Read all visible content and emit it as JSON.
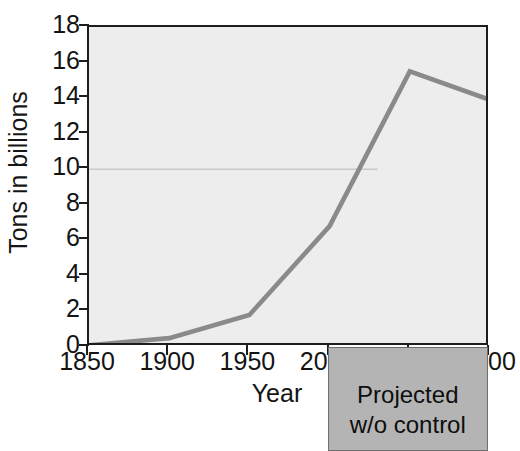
{
  "chart_data": {
    "type": "line",
    "title": "",
    "subtitle": "",
    "xlabel": "Year",
    "ylabel": "Tons in billions",
    "xlim": [
      1850,
      2100
    ],
    "ylim": [
      0,
      18
    ],
    "grid": false,
    "legend": null,
    "x": [
      1850,
      1900,
      1950,
      2000,
      2050,
      2100
    ],
    "values": [
      0.1,
      0.5,
      1.8,
      6.8,
      15.5,
      13.9
    ],
    "series": [
      {
        "name": "Carbon emissions",
        "color": "#8a8a8a",
        "x": [
          1850,
          1900,
          1950,
          2000,
          2050,
          2100
        ],
        "values": [
          0.1,
          0.5,
          1.8,
          6.8,
          15.5,
          13.9
        ]
      }
    ],
    "xticks": [
      1850,
      1900,
      1950,
      2000,
      2050,
      2100
    ],
    "xtick_labels": [
      "1850",
      "1900",
      "1950",
      "2000",
      "2050",
      "2100"
    ],
    "yticks": [
      0,
      2,
      4,
      6,
      8,
      10,
      12,
      14,
      16,
      18
    ],
    "ytick_labels": [
      "0",
      "2",
      "4",
      "6",
      "8",
      "10",
      "12",
      "14",
      "16",
      "18"
    ],
    "reference_line": {
      "name": "faint-horizontal-guide",
      "y": 10,
      "x_start": 1850,
      "x_end": 2030,
      "color": "#c9c9c9"
    },
    "annotations": [
      {
        "name": "projected-region",
        "line1": "Projected",
        "line2": "w/o control",
        "x_start": 2000,
        "x_end": 2100,
        "color": "#b4b4b4"
      }
    ]
  },
  "axes": {
    "y_title": "Tons in billions",
    "x_title": "Year"
  },
  "projected": {
    "line1": "Projected",
    "line2": "w/o control"
  },
  "colors": {
    "plot_background": "#ededed",
    "line": "#8a8a8a",
    "axis": "#1d1d1d",
    "projected_box": "#b4b4b4",
    "reference_line": "#c9c9c9",
    "page_background": "#ffffff"
  }
}
